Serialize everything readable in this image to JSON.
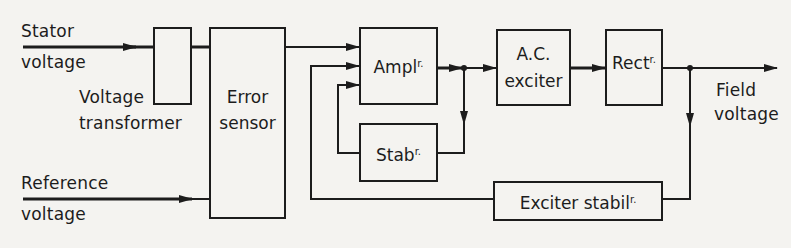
{
  "diagram": {
    "inputs": {
      "stator": {
        "line1": "Stator",
        "line2": "voltage"
      },
      "reference": {
        "line1": "Reference",
        "line2": "voltage"
      }
    },
    "output": {
      "line1": "Field",
      "line2": "voltage"
    },
    "blocks": {
      "voltage_transformer": {
        "line1": "Voltage",
        "line2": "transformer"
      },
      "error_sensor": {
        "line1": "Error",
        "line2": "sensor"
      },
      "amplifier": {
        "text": "Ampl",
        "sup": "r."
      },
      "stabilizer": {
        "text": "Stab",
        "sup": "r."
      },
      "ac_exciter": {
        "line1": "A.C.",
        "line2": "exciter"
      },
      "rectifier": {
        "text": "Rect",
        "sup": "r."
      },
      "exciter_stabilizer": {
        "text": "Exciter stabil",
        "sup": "r."
      }
    },
    "colors": {
      "line": "#1c1c1c",
      "paper": "#f4f3f0"
    }
  }
}
